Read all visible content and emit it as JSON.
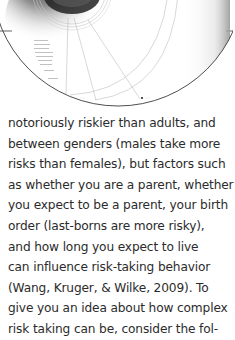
{
  "figure": {
    "labels": [
      {
        "text": "?????",
        "x": 83,
        "y": 99
      },
      {
        "text": "?????",
        "x": 145,
        "y": 99
      }
    ],
    "colors": {
      "outline": "#3a3a3a",
      "arcs": "#b9b9b9",
      "shading": "#1a1a1a",
      "marker": "#555555"
    }
  },
  "body": {
    "lines": [
      "notoriously riskier than adults, and",
      "between genders (males take more",
      "risks than females), but factors such",
      "as whether you are a parent, whether",
      "you expect to be a parent, your birth",
      "order (last-borns are more risky),",
      "and how long you expect to live",
      "can influence risk-taking behavior",
      "(Wang, Kruger, & Wilke, 2009). To",
      "give you an idea about how complex",
      "risk taking can be, consider the fol-"
    ]
  }
}
